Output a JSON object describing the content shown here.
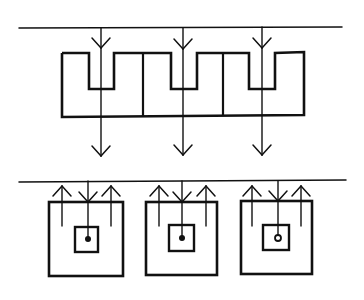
{
  "diagram": {
    "title": "",
    "stroke_color": "#111111",
    "background": "#ffffff",
    "top_panel": {
      "surface_line": {
        "x1": 19,
        "y1": 28,
        "x2": 342,
        "y2": 27
      },
      "outline_points": "62,53 89,53 89,89 114,89 114,53 171,53 171,89 197,89 197,53 249,53 249,89 275,89 275,53 304,52 304,115 62,117 62,53",
      "dividers": [
        {
          "x": 143,
          "y1": 53,
          "y2": 116
        },
        {
          "x": 223,
          "y1": 53,
          "y2": 115
        }
      ],
      "flow_lines": [
        {
          "x": 101,
          "y1": 28,
          "y2": 156,
          "head_top_y": 48,
          "head_bottom_y": 156
        },
        {
          "x": 183,
          "y1": 28,
          "y2": 155,
          "head_top_y": 49,
          "head_bottom_y": 155
        },
        {
          "x": 262,
          "y1": 27,
          "y2": 155,
          "head_top_y": 48,
          "head_bottom_y": 155
        }
      ]
    },
    "bottom_panel": {
      "surface_line": {
        "x1": 19,
        "y1": 182,
        "x2": 346,
        "y2": 180
      },
      "cells": [
        {
          "outer": {
            "x": 49,
            "y": 202,
            "w": 74,
            "h": 74
          },
          "inner": {
            "x": 75,
            "y": 227,
            "w": 23,
            "h": 25
          },
          "center_x": 88,
          "dot_y": 239,
          "dot_style": "filled",
          "up_arrows": [
            62,
            111
          ]
        },
        {
          "outer": {
            "x": 146,
            "y": 202,
            "w": 71,
            "h": 73
          },
          "inner": {
            "x": 169,
            "y": 225,
            "w": 25,
            "h": 26
          },
          "center_x": 182,
          "dot_y": 238,
          "dot_style": "filled",
          "up_arrows": [
            159,
            206
          ]
        },
        {
          "outer": {
            "x": 241,
            "y": 201,
            "w": 71,
            "h": 73
          },
          "inner": {
            "x": 263,
            "y": 225,
            "w": 26,
            "h": 25
          },
          "center_x": 278,
          "dot_y": 238,
          "dot_style": "ring",
          "up_arrows": [
            252,
            301
          ]
        }
      ]
    }
  }
}
